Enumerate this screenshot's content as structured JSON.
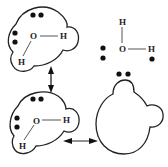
{
  "diagram": {
    "colors": {
      "stroke": "#222222",
      "background": "#ffffff"
    },
    "molecules": [
      {
        "id": "upper-left",
        "atoms": {
          "oxygen": "O",
          "hydrogen_right": "H",
          "hydrogen_lower": "H"
        }
      },
      {
        "id": "lower-left",
        "atoms": {
          "oxygen": "O",
          "hydrogen_right": "H",
          "hydrogen_lower": "H"
        }
      },
      {
        "id": "upper-right",
        "atoms": {
          "hydrogen_top": "H",
          "oxygen": "O",
          "hydrogen_right": "H"
        }
      }
    ],
    "arrows": [
      {
        "id": "vertical",
        "type": "double-headed"
      },
      {
        "id": "horizontal",
        "type": "double-headed"
      }
    ]
  }
}
